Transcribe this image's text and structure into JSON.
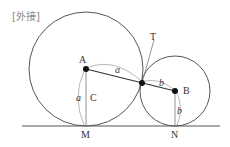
{
  "title": "[外接]",
  "points": {
    "A": "A",
    "B": "B",
    "C": "C",
    "T": "T",
    "M": "M",
    "N": "N"
  },
  "segment_labels": {
    "a_arc": "a",
    "a_vertical": "a",
    "b_arc": "b",
    "b_vertical": "b"
  },
  "colors": {
    "line": "#555555",
    "point": "#111111",
    "text": "#333333"
  }
}
